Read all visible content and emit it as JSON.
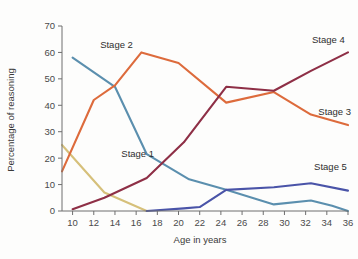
{
  "chart_data": {
    "type": "line",
    "title": "",
    "xlabel": "Age in years",
    "ylabel": "Percentage of reasoning",
    "xlim": [
      9,
      36
    ],
    "ylim": [
      0,
      70
    ],
    "xticks": [
      10,
      12,
      14,
      16,
      18,
      20,
      22,
      24,
      26,
      28,
      30,
      32,
      34,
      36
    ],
    "yticks": [
      0,
      10,
      20,
      30,
      40,
      50,
      60,
      70
    ],
    "grid": false,
    "legend_position": "inline-labels",
    "series": [
      {
        "name": "Stage 1",
        "color": "#d6c07a",
        "label_x": 14.6,
        "label_y": 20.5,
        "x": [
          9,
          13,
          17
        ],
        "values": [
          25,
          7,
          0
        ]
      },
      {
        "name": "Stage 2",
        "color": "#5b8fae",
        "label_x": 12.6,
        "label_y": 61.5,
        "x": [
          10,
          14,
          17,
          21,
          24.5,
          29,
          32.5,
          34.5,
          36
        ],
        "values": [
          58,
          47,
          21.5,
          12,
          8,
          2.5,
          4,
          2,
          0
        ]
      },
      {
        "name": "Stage 3",
        "color": "#dd6b3c",
        "label_x": 33.2,
        "label_y": 36.5,
        "x": [
          9,
          12,
          14,
          16.5,
          20,
          24.5,
          29,
          32.5,
          36
        ],
        "values": [
          15,
          42,
          47.5,
          60,
          56,
          41,
          45,
          36.5,
          32.5
        ]
      },
      {
        "name": "Stage 4",
        "color": "#8e2f46",
        "label_x": 32.6,
        "label_y": 63.5,
        "x": [
          10,
          13,
          17,
          20.5,
          24.5,
          29,
          32.5,
          36
        ],
        "values": [
          0.7,
          5,
          12.5,
          26,
          47,
          45.5,
          53,
          60
        ]
      },
      {
        "name": "Stage 5",
        "color": "#4a54a8",
        "label_x": 32.8,
        "label_y": 15.5,
        "x": [
          17,
          20.5,
          22,
          24.5,
          29,
          32.5,
          36
        ],
        "values": [
          0,
          1,
          1.5,
          8,
          9,
          10.5,
          7.7
        ]
      }
    ]
  },
  "axis": {
    "x_title": "Age in years",
    "y_title": "Percentage of reasoning"
  }
}
